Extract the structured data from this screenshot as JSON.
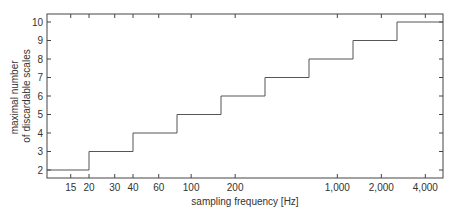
{
  "chart_data": {
    "type": "line",
    "subtype": "step",
    "title": "",
    "xlabel": "sampling frequency [Hz]",
    "ylabel_lines": [
      "maximal number",
      "of discardable scales"
    ],
    "xscale": "log",
    "xlim": [
      10,
      5000
    ],
    "ylim": [
      1.5,
      10.4
    ],
    "x_ticks": [
      15,
      20,
      30,
      40,
      60,
      100,
      200,
      1000,
      2000,
      4000
    ],
    "x_tick_labels": [
      "15",
      "20",
      "30",
      "40",
      "60",
      "100",
      "200",
      "1,000",
      "2,000",
      "4,000"
    ],
    "y_ticks": [
      2,
      3,
      4,
      5,
      6,
      7,
      8,
      9,
      10
    ],
    "y_tick_labels": [
      "2",
      "3",
      "4",
      "5",
      "6",
      "7",
      "8",
      "9",
      "10"
    ],
    "grid": false,
    "legend": null,
    "series": [
      {
        "name": "maximal number of discardable scales",
        "color": "#555555",
        "x": [
          10,
          20,
          40,
          80,
          160,
          320,
          640,
          1280,
          2560,
          5000
        ],
        "values": [
          2,
          3,
          4,
          5,
          6,
          7,
          8,
          9,
          10,
          10
        ]
      }
    ]
  },
  "colors": {
    "axis": "#444444",
    "line": "#555555",
    "text": "#333333"
  }
}
